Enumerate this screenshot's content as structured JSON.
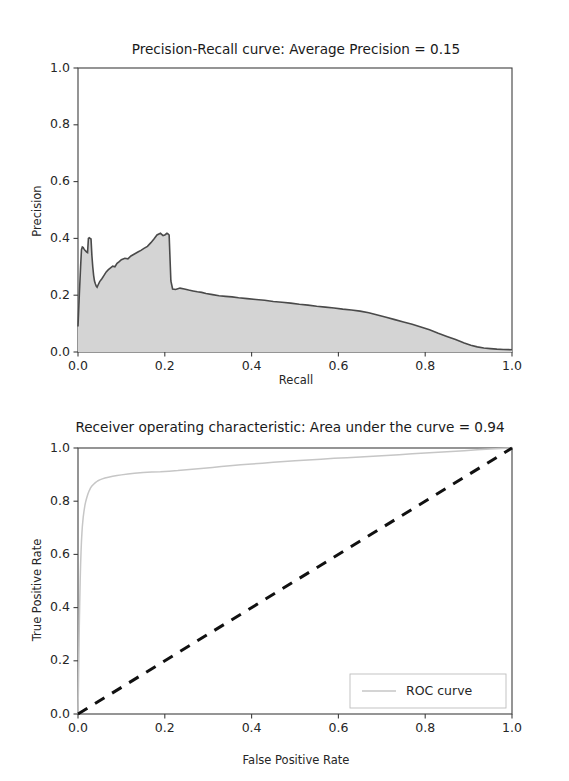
{
  "page": {
    "background": "#ffffff",
    "width": 569,
    "height": 781
  },
  "colors": {
    "pr_fill": "#d4d4d4",
    "pr_line": "#4a4a4a",
    "roc_line": "#c6c6c6",
    "diagonal_line": "#111111",
    "axis": "#3f3f3f",
    "text": "#262626"
  },
  "chart_data": [
    {
      "id": "precision-recall",
      "type": "line",
      "title": "Precision-Recall curve: Average Precision =    0.15",
      "title_parts": {
        "prefix": "Precision-Recall curve: Average Precision =",
        "value": "0.15"
      },
      "xlabel": "Recall",
      "ylabel": "Precision",
      "xlim": [
        0.0,
        1.0
      ],
      "ylim": [
        0.0,
        1.0
      ],
      "xticks": [
        0.0,
        0.2,
        0.4,
        0.6,
        0.8,
        1.0
      ],
      "yticks": [
        0.0,
        0.2,
        0.4,
        0.6,
        0.8,
        1.0
      ],
      "xticklabels": [
        "0.0",
        "0.2",
        "0.4",
        "0.6",
        "0.8",
        "1.0"
      ],
      "yticklabels": [
        "0.0",
        "0.2",
        "0.4",
        "0.6",
        "0.8",
        "1.0"
      ],
      "grid": false,
      "filled": true,
      "average_precision": 0.15,
      "series": [
        {
          "name": "Precision-Recall",
          "x": [
            0.0,
            0.003,
            0.006,
            0.008,
            0.01,
            0.012,
            0.014,
            0.016,
            0.018,
            0.02,
            0.022,
            0.024,
            0.026,
            0.028,
            0.03,
            0.032,
            0.034,
            0.036,
            0.038,
            0.04,
            0.042,
            0.044,
            0.046,
            0.05,
            0.055,
            0.06,
            0.065,
            0.07,
            0.075,
            0.08,
            0.085,
            0.09,
            0.095,
            0.1,
            0.108,
            0.115,
            0.122,
            0.13,
            0.138,
            0.145,
            0.152,
            0.16,
            0.168,
            0.175,
            0.182,
            0.19,
            0.196,
            0.2,
            0.205,
            0.208,
            0.21,
            0.212,
            0.214,
            0.218,
            0.225,
            0.235,
            0.245,
            0.255,
            0.265,
            0.275,
            0.285,
            0.295,
            0.31,
            0.325,
            0.34,
            0.355,
            0.37,
            0.39,
            0.41,
            0.43,
            0.45,
            0.47,
            0.49,
            0.51,
            0.53,
            0.55,
            0.57,
            0.59,
            0.61,
            0.63,
            0.65,
            0.67,
            0.69,
            0.71,
            0.73,
            0.75,
            0.77,
            0.79,
            0.81,
            0.83,
            0.85,
            0.87,
            0.89,
            0.905,
            0.92,
            0.935,
            0.95,
            0.965,
            0.98,
            1.0
          ],
          "y": [
            0.09,
            0.2,
            0.3,
            0.36,
            0.37,
            0.368,
            0.362,
            0.358,
            0.355,
            0.352,
            0.35,
            0.4,
            0.402,
            0.4,
            0.398,
            0.34,
            0.3,
            0.27,
            0.25,
            0.24,
            0.232,
            0.228,
            0.235,
            0.248,
            0.258,
            0.27,
            0.282,
            0.29,
            0.296,
            0.302,
            0.3,
            0.312,
            0.318,
            0.325,
            0.33,
            0.328,
            0.338,
            0.345,
            0.352,
            0.358,
            0.365,
            0.372,
            0.385,
            0.398,
            0.412,
            0.418,
            0.41,
            0.412,
            0.418,
            0.415,
            0.412,
            0.33,
            0.25,
            0.222,
            0.22,
            0.225,
            0.222,
            0.218,
            0.215,
            0.212,
            0.21,
            0.206,
            0.202,
            0.198,
            0.196,
            0.194,
            0.191,
            0.188,
            0.185,
            0.182,
            0.178,
            0.175,
            0.172,
            0.168,
            0.165,
            0.161,
            0.158,
            0.155,
            0.151,
            0.148,
            0.144,
            0.138,
            0.13,
            0.122,
            0.114,
            0.106,
            0.098,
            0.088,
            0.078,
            0.066,
            0.055,
            0.044,
            0.032,
            0.024,
            0.018,
            0.014,
            0.012,
            0.01,
            0.009,
            0.008
          ]
        }
      ]
    },
    {
      "id": "roc",
      "type": "line",
      "title": "Receiver operating characteristic:    Area under the curve = 0.94",
      "title_parts": {
        "prefix": "Receiver operating characteristic:",
        "suffix": "Area under the curve = 0.94"
      },
      "xlabel": "False Positive Rate",
      "ylabel": "True Positive Rate",
      "xlim": [
        0.0,
        1.0
      ],
      "ylim": [
        0.0,
        1.0
      ],
      "xticks": [
        0.0,
        0.2,
        0.4,
        0.6,
        0.8,
        1.0
      ],
      "yticks": [
        0.0,
        0.2,
        0.4,
        0.6,
        0.8,
        1.0
      ],
      "xticklabels": [
        "0.0",
        "0.2",
        "0.4",
        "0.6",
        "0.8",
        "1.0"
      ],
      "yticklabels": [
        "0.0",
        "0.2",
        "0.4",
        "0.6",
        "0.8",
        "1.0"
      ],
      "grid": false,
      "auc": 0.94,
      "legend": {
        "position": "lower right",
        "entries": [
          {
            "label": "ROC curve",
            "color": "#c6c6c6",
            "style": "solid"
          }
        ]
      },
      "series": [
        {
          "name": "ROC curve",
          "x": [
            0.0,
            0.001,
            0.002,
            0.003,
            0.004,
            0.005,
            0.006,
            0.007,
            0.008,
            0.009,
            0.01,
            0.012,
            0.014,
            0.016,
            0.018,
            0.02,
            0.023,
            0.026,
            0.029,
            0.032,
            0.036,
            0.04,
            0.045,
            0.05,
            0.056,
            0.062,
            0.07,
            0.08,
            0.09,
            0.1,
            0.115,
            0.13,
            0.15,
            0.17,
            0.19,
            0.21,
            0.23,
            0.25,
            0.27,
            0.29,
            0.31,
            0.33,
            0.35,
            0.375,
            0.4,
            0.425,
            0.45,
            0.475,
            0.5,
            0.53,
            0.56,
            0.59,
            0.62,
            0.65,
            0.68,
            0.71,
            0.74,
            0.77,
            0.8,
            0.83,
            0.86,
            0.89,
            0.92,
            0.95,
            0.975,
            1.0
          ],
          "y": [
            0.0,
            0.1,
            0.22,
            0.33,
            0.42,
            0.5,
            0.56,
            0.61,
            0.65,
            0.68,
            0.705,
            0.74,
            0.765,
            0.785,
            0.8,
            0.812,
            0.828,
            0.84,
            0.85,
            0.857,
            0.864,
            0.87,
            0.876,
            0.88,
            0.884,
            0.887,
            0.89,
            0.894,
            0.897,
            0.899,
            0.902,
            0.905,
            0.908,
            0.91,
            0.911,
            0.913,
            0.915,
            0.918,
            0.921,
            0.924,
            0.927,
            0.93,
            0.933,
            0.937,
            0.94,
            0.943,
            0.946,
            0.949,
            0.952,
            0.955,
            0.958,
            0.961,
            0.963,
            0.966,
            0.969,
            0.972,
            0.975,
            0.978,
            0.981,
            0.984,
            0.987,
            0.99,
            0.993,
            0.996,
            0.998,
            1.0
          ]
        },
        {
          "name": "chance",
          "style": "dashed",
          "color": "#111111",
          "x": [
            0.0,
            1.0
          ],
          "y": [
            0.0,
            1.0
          ]
        }
      ]
    }
  ]
}
